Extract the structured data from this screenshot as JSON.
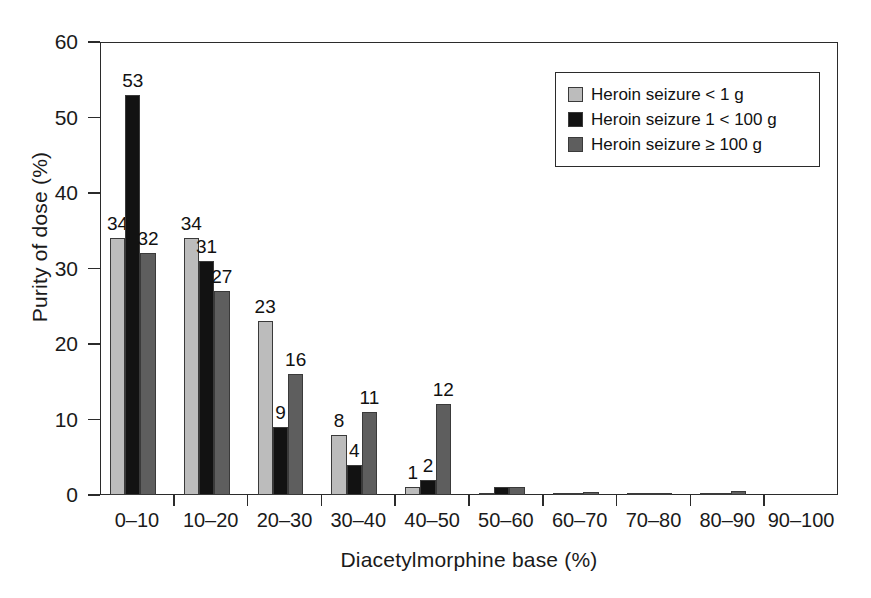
{
  "chart_data": {
    "type": "bar",
    "title": "",
    "xlabel": "Diacetylmorphine base (%)",
    "ylabel": "Purity of dose (%)",
    "categories": [
      "0–10",
      "10–20",
      "20–30",
      "30–40",
      "40–50",
      "50–60",
      "60–70",
      "70–80",
      "80–90",
      "90–100"
    ],
    "series": [
      {
        "name": "Heroin seizure < 1 g",
        "color": "#bcbcbc",
        "values": [
          34,
          34,
          23,
          8,
          1,
          0.2,
          0.2,
          0.3,
          0.2,
          0
        ],
        "labels": [
          "34",
          "34",
          "23",
          "8",
          "1",
          "",
          "",
          "",
          "",
          ""
        ]
      },
      {
        "name": "Heroin seizure 1 < 100 g",
        "color": "#121212",
        "values": [
          53,
          31,
          9,
          4,
          2,
          1.0,
          0.2,
          0.2,
          0.15,
          0
        ],
        "labels": [
          "53",
          "31",
          "9",
          "4",
          "2",
          "",
          "",
          "",
          "",
          ""
        ]
      },
      {
        "name": "Heroin seizure ≥ 100 g",
        "color": "#5e5e5e",
        "values": [
          32,
          27,
          16,
          11,
          12,
          1.0,
          0.4,
          0.2,
          0.5,
          0
        ],
        "labels": [
          "32",
          "27",
          "16",
          "11",
          "12",
          "",
          "",
          "",
          "",
          ""
        ]
      }
    ],
    "ylim": [
      0,
      60
    ],
    "yticks": [
      0,
      10,
      20,
      30,
      40,
      50,
      60
    ],
    "ytick_labels": [
      "0",
      "10",
      "20",
      "30",
      "40",
      "50",
      "60"
    ],
    "grid": false,
    "legend_position": "top-right"
  },
  "legend": {
    "items": [
      {
        "label": "Heroin seizure < 1 g",
        "color": "#bcbcbc"
      },
      {
        "label": "Heroin seizure 1 < 100 g",
        "color": "#121212"
      },
      {
        "label": "Heroin seizure ≥ 100 g",
        "color": "#5e5e5e"
      }
    ]
  }
}
